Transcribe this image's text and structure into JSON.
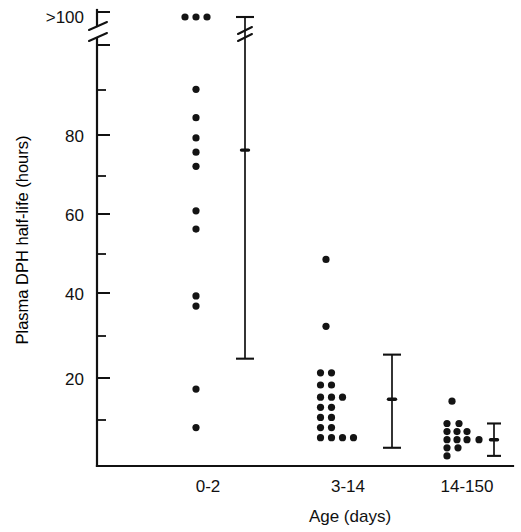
{
  "chart_data": {
    "type": "scatter",
    "title": "",
    "xlabel": "Age (days)",
    "ylabel": "Plasma DPH half-life (hours)",
    "ylim": [
      0,
      100
    ],
    "ytick_labels": [
      "20",
      "40",
      "60",
      "80"
    ],
    "yticks": [
      20,
      40,
      60,
      80
    ],
    "y_minor_ticks": [
      10,
      30,
      50,
      70,
      90
    ],
    "y_break_label": ">100",
    "grid": false,
    "legend": false,
    "axis_break": {
      "present": true,
      "axis": "y",
      "note": "broken axis below >100 marker"
    },
    "categories": [
      "0-2",
      "3-14",
      "14-150"
    ],
    "series": [
      {
        "name": "0-2",
        "category": "0-2",
        "points": [
          {
            "value": 100,
            "offset": -1,
            "above_limit": true
          },
          {
            "value": 100,
            "offset": 0,
            "above_limit": true
          },
          {
            "value": 100,
            "offset": 1,
            "above_limit": true
          },
          {
            "value": 93,
            "offset": 0
          },
          {
            "value": 86,
            "offset": 0
          },
          {
            "value": 81,
            "offset": 0
          },
          {
            "value": 77.5,
            "offset": 0
          },
          {
            "value": 74,
            "offset": 0
          },
          {
            "value": 63,
            "offset": 0
          },
          {
            "value": 58.5,
            "offset": 0
          },
          {
            "value": 42,
            "offset": 0
          },
          {
            "value": 39.5,
            "offset": 0
          },
          {
            "value": 19,
            "offset": 0
          },
          {
            "value": 9.5,
            "offset": 0
          }
        ],
        "errorbar": {
          "top": 100,
          "mean": 78,
          "bottom": 26.5,
          "top_broken": true
        }
      },
      {
        "name": "3-14",
        "category": "3-14",
        "points": [
          {
            "value": 51,
            "offset": 0
          },
          {
            "value": 34.5,
            "offset": 0
          },
          {
            "value": 23,
            "offset": -0.5
          },
          {
            "value": 23,
            "offset": 0.5
          },
          {
            "value": 20,
            "offset": -0.5
          },
          {
            "value": 20,
            "offset": 0.5
          },
          {
            "value": 17,
            "offset": -0.5
          },
          {
            "value": 17,
            "offset": 0.5
          },
          {
            "value": 17,
            "offset": 1.5
          },
          {
            "value": 14.5,
            "offset": -0.5
          },
          {
            "value": 14.5,
            "offset": 0.5
          },
          {
            "value": 12,
            "offset": -0.5
          },
          {
            "value": 12,
            "offset": 0.5
          },
          {
            "value": 9.5,
            "offset": -0.5
          },
          {
            "value": 9.5,
            "offset": 0.5
          },
          {
            "value": 7,
            "offset": -0.5
          },
          {
            "value": 7,
            "offset": 0.5
          },
          {
            "value": 7,
            "offset": 1.5
          },
          {
            "value": 7,
            "offset": 2.5
          }
        ],
        "errorbar": {
          "top": 27.5,
          "mean": 16.5,
          "bottom": 4.5,
          "top_broken": false
        }
      },
      {
        "name": "14-150",
        "category": "14-150",
        "points": [
          {
            "value": 16,
            "offset": 0
          },
          {
            "value": 10.5,
            "offset": -0.5
          },
          {
            "value": 10.5,
            "offset": 0.7
          },
          {
            "value": 8.5,
            "offset": -0.5
          },
          {
            "value": 8.5,
            "offset": 0.5
          },
          {
            "value": 8.5,
            "offset": 1.5
          },
          {
            "value": 6.5,
            "offset": -0.5
          },
          {
            "value": 6.5,
            "offset": 0.5
          },
          {
            "value": 6.5,
            "offset": 1.5
          },
          {
            "value": 6.5,
            "offset": 2.7
          },
          {
            "value": 4.5,
            "offset": -0.5
          },
          {
            "value": 4.5,
            "offset": 0.6
          },
          {
            "value": 2.5,
            "offset": -0.5
          }
        ],
        "errorbar": {
          "top": 10.5,
          "mean": 6.5,
          "bottom": 2.5,
          "top_broken": false
        }
      }
    ]
  },
  "axes": {
    "y_axis_title": "Plasma DPH half-life (hours)",
    "x_axis_title": "Age (days)",
    "above_limit_label": ">100",
    "y_tick_20": "20",
    "y_tick_40": "40",
    "y_tick_60": "60",
    "y_tick_80": "80",
    "x_cat_1": "0-2",
    "x_cat_2": "3-14",
    "x_cat_3": "14-150"
  },
  "colors": {
    "ink": "#111111",
    "background": "#ffffff"
  }
}
